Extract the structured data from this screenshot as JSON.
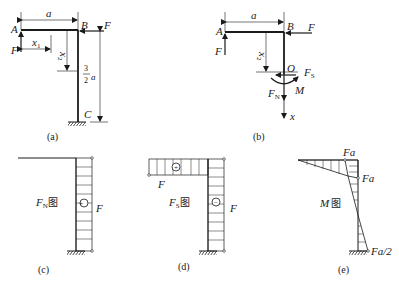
{
  "figure_a": {
    "caption": "(a)",
    "labels": {
      "A": "A",
      "B": "B",
      "C": "C",
      "F_left": "F",
      "F_right": "F",
      "a": "a",
      "x1": "x",
      "x1_sub": "1",
      "x2": "x",
      "x2_sub": "2",
      "frac_num": "3",
      "frac_den": "2",
      "frac_var": "a"
    }
  },
  "figure_b": {
    "caption": "(b)",
    "labels": {
      "A": "A",
      "B": "B",
      "O": "O",
      "F_left": "F",
      "F_right": "F",
      "a": "a",
      "x2": "x",
      "x2_sub": "2",
      "Fs": "F",
      "Fs_sub": "S",
      "FN": "F",
      "FN_sub": "N",
      "M": "M",
      "x": "x"
    }
  },
  "figure_c": {
    "caption": "(c)",
    "title": "F",
    "title_sub": "N",
    "title_suffix": "图",
    "sign": "+",
    "value_label": "F"
  },
  "figure_d": {
    "caption": "(d)",
    "title": "F",
    "title_sub": "S",
    "title_suffix": "图",
    "sign_horizontal": "+",
    "sign_vertical": "−",
    "value_label_horizontal": "F",
    "value_label_vertical": "F"
  },
  "figure_e": {
    "caption": "(e)",
    "title": "M",
    "title_suffix": "图",
    "value_top": "Fa",
    "value_corner": "Fa",
    "value_bottom": "Fa/2"
  }
}
